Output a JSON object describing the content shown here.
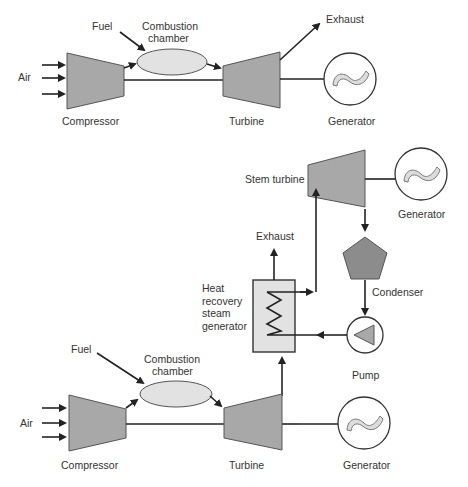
{
  "top_cycle": {
    "title": "Simple gas turbine cycle",
    "labels": {
      "air": "Air",
      "fuel": "Fuel",
      "combustion_line1": "Combustion",
      "combustion_line2": "chamber",
      "exhaust": "Exhaust",
      "compressor": "Compressor",
      "turbine": "Turbine",
      "generator": "Generator"
    }
  },
  "bottom_cycle": {
    "title": "Combined cycle",
    "labels": {
      "air": "Air",
      "fuel": "Fuel",
      "combustion_line1": "Combustion",
      "combustion_line2": "chamber",
      "compressor": "Compressor",
      "turbine": "Turbine",
      "generator": "Generator",
      "exhaust": "Exhaust",
      "hrsg_line1": "Heat",
      "hrsg_line2": "recovery",
      "hrsg_line3": "steam",
      "hrsg_line4": "generator",
      "steam_turbine": "Stem turbine",
      "steam_generator": "Generator",
      "condenser": "Condenser",
      "pump": "Pump"
    }
  },
  "colors": {
    "machine_fill": "#a8a8a8",
    "chamber_fill": "#e2e2e2",
    "line": "#222222",
    "text": "#333333"
  }
}
